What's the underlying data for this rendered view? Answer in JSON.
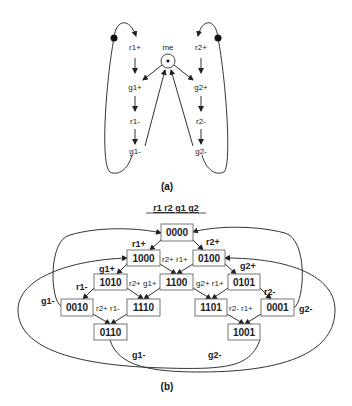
{
  "figure_a": {
    "caption": "(a)",
    "center_label": "me",
    "left_column": [
      "r1+",
      "g1+",
      "r1-",
      "g1-"
    ],
    "right_column": [
      "r2+",
      "g2+",
      "r2-",
      "g2-"
    ]
  },
  "figure_b": {
    "caption": "(b)",
    "header": "r1 r2 g1 g2",
    "nodes": {
      "n0000": "0000",
      "n1000": "1000",
      "n0100": "0100",
      "n1010": "1010",
      "n1100": "1100",
      "n0101": "0101",
      "n0010": "0010",
      "n1110": "1110",
      "n1101": "1101",
      "n0001": "0001",
      "n0110": "0110",
      "n1001": "1001"
    },
    "edge_labels": {
      "r1plus_top": "r1+",
      "r2plus_top": "r2+",
      "g1plus": "g1+",
      "g2plus": "g2+",
      "r2plus_r1plus": "r2+ r1+",
      "r1minus": "r1-",
      "r2plus_g1plus": "r2+ g1+",
      "g2plus_r1plus": "g2+ r1+",
      "r2minus": "r2-",
      "g1minus_left": "g1-",
      "r2plus_r1minus": "r2+ r1-",
      "r2minus_r1plus": "r2- r1+",
      "g2minus_right": "g2-",
      "g1minus_bottom": "g1-",
      "g2minus_bottom": "g2-"
    }
  }
}
